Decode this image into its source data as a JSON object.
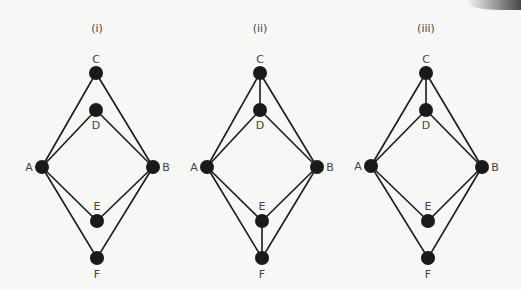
{
  "figure": {
    "background": "#f7f7f5",
    "edge_color": "#1a1a1a",
    "node_color": "#1a1a1a",
    "label_color": "#444444",
    "node_radius": 7,
    "panels": [
      {
        "id": "i",
        "title": "(i)",
        "title_pos": [
          97,
          32
        ],
        "nodes": {
          "C": {
            "x": 96,
            "y": 73,
            "label": "C",
            "label_dx": 0,
            "label_dy": -10
          },
          "D": {
            "x": 96,
            "y": 110,
            "label": "D",
            "label_dx": 0,
            "label_dy": 19
          },
          "A": {
            "x": 42,
            "y": 167,
            "label": "A",
            "label_dx": -13,
            "label_dy": 4
          },
          "B": {
            "x": 153,
            "y": 167,
            "label": "B",
            "label_dx": 13,
            "label_dy": 4
          },
          "E": {
            "x": 97,
            "y": 221,
            "label": "E",
            "label_dx": 0,
            "label_dy": -11
          },
          "F": {
            "x": 97,
            "y": 258,
            "label": "F",
            "label_dx": 0,
            "label_dy": 20
          }
        },
        "edges": [
          [
            "A",
            "C"
          ],
          [
            "A",
            "D"
          ],
          [
            "C",
            "B"
          ],
          [
            "D",
            "B"
          ],
          [
            "A",
            "E"
          ],
          [
            "A",
            "F"
          ],
          [
            "E",
            "B"
          ],
          [
            "F",
            "B"
          ]
        ]
      },
      {
        "id": "ii",
        "title": "(ii)",
        "title_pos": [
          260,
          32
        ],
        "nodes": {
          "C": {
            "x": 260,
            "y": 73,
            "label": "C",
            "label_dx": 0,
            "label_dy": -10
          },
          "D": {
            "x": 260,
            "y": 110,
            "label": "D",
            "label_dx": 0,
            "label_dy": 19
          },
          "A": {
            "x": 207,
            "y": 167,
            "label": "A",
            "label_dx": -13,
            "label_dy": 4
          },
          "B": {
            "x": 317,
            "y": 167,
            "label": "B",
            "label_dx": 13,
            "label_dy": 4
          },
          "E": {
            "x": 262,
            "y": 221,
            "label": "E",
            "label_dx": 0,
            "label_dy": -11
          },
          "F": {
            "x": 262,
            "y": 258,
            "label": "F",
            "label_dx": 0,
            "label_dy": 20
          }
        },
        "edges": [
          [
            "A",
            "C"
          ],
          [
            "A",
            "D"
          ],
          [
            "C",
            "B"
          ],
          [
            "D",
            "B"
          ],
          [
            "C",
            "D"
          ],
          [
            "A",
            "E"
          ],
          [
            "A",
            "F"
          ],
          [
            "E",
            "B"
          ],
          [
            "F",
            "B"
          ],
          [
            "E",
            "F"
          ]
        ]
      },
      {
        "id": "iii",
        "title": "(iii)",
        "title_pos": [
          426,
          32
        ],
        "nodes": {
          "C": {
            "x": 426,
            "y": 73,
            "label": "C",
            "label_dx": 0,
            "label_dy": -10
          },
          "D": {
            "x": 426,
            "y": 110,
            "label": "D",
            "label_dx": 0,
            "label_dy": 19
          },
          "A": {
            "x": 371,
            "y": 166,
            "label": "A",
            "label_dx": -13,
            "label_dy": 4
          },
          "B": {
            "x": 482,
            "y": 167,
            "label": "B",
            "label_dx": 13,
            "label_dy": 4
          },
          "E": {
            "x": 428,
            "y": 221,
            "label": "E",
            "label_dx": 0,
            "label_dy": -11
          },
          "F": {
            "x": 428,
            "y": 258,
            "label": "F",
            "label_dx": 0,
            "label_dy": 20
          }
        },
        "edges": [
          [
            "A",
            "C"
          ],
          [
            "A",
            "D"
          ],
          [
            "C",
            "B"
          ],
          [
            "D",
            "B"
          ],
          [
            "C",
            "D"
          ],
          [
            "A",
            "E"
          ],
          [
            "A",
            "F"
          ],
          [
            "E",
            "B"
          ],
          [
            "F",
            "B"
          ]
        ]
      }
    ]
  }
}
